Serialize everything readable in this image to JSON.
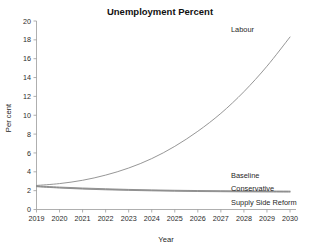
{
  "chart_data": {
    "type": "line",
    "title": "Unemployment Percent",
    "xlabel": "Year",
    "ylabel": "Per cent",
    "grid": false,
    "legend_position": "inline-right-labels",
    "x": [
      2019,
      2020,
      2021,
      2022,
      2023,
      2024,
      2025,
      2026,
      2027,
      2028,
      2029,
      2030
    ],
    "xtick_labels": [
      "2019",
      "2020",
      "2021",
      "2022",
      "2023",
      "2024",
      "2025",
      "2026",
      "2027",
      "2028",
      "2029",
      "2030"
    ],
    "ytick_labels": [
      "0",
      "2",
      "4",
      "6",
      "8",
      "10",
      "12",
      "14",
      "16",
      "18",
      "20"
    ],
    "xlim": [
      2019,
      2030
    ],
    "ylim": [
      0,
      20
    ],
    "series": [
      {
        "name": "Labour",
        "values": [
          2.55,
          2.75,
          3.1,
          3.65,
          4.4,
          5.4,
          6.7,
          8.3,
          10.2,
          12.5,
          15.2,
          18.3
        ]
      },
      {
        "name": "Baseline",
        "values": [
          2.5,
          2.38,
          2.28,
          2.2,
          2.13,
          2.08,
          2.04,
          2.01,
          1.99,
          1.97,
          1.96,
          1.95
        ]
      },
      {
        "name": "Conservative",
        "values": [
          2.45,
          2.32,
          2.22,
          2.14,
          2.08,
          2.03,
          1.99,
          1.96,
          1.94,
          1.92,
          1.91,
          1.9
        ]
      },
      {
        "name": "Supply Side Reform",
        "values": [
          2.42,
          2.28,
          2.17,
          2.09,
          2.03,
          1.98,
          1.94,
          1.91,
          1.89,
          1.87,
          1.86,
          1.85
        ]
      }
    ],
    "colors": {
      "line": "#8a8a8a",
      "axis": "#9a9a9a",
      "text": "#1f1f1f",
      "background": "#ffffff"
    }
  },
  "labels": {
    "labour": "Labour",
    "baseline": "Baseline",
    "conservative": "Conservative",
    "supply_side_reform": "Supply Side Reform"
  }
}
